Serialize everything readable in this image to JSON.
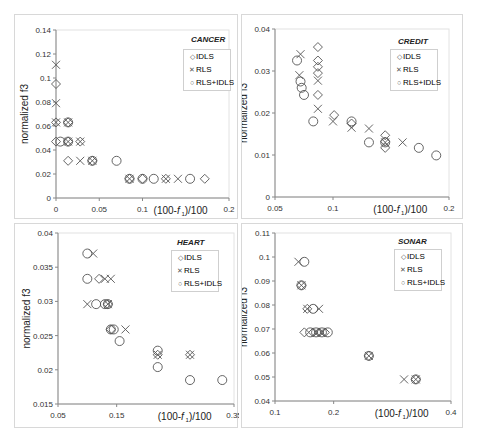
{
  "chart_data": [
    {
      "type": "scatter",
      "title": "CANCER",
      "xlabel": "(100-f1)/100",
      "ylabel": "normalized f3",
      "xlim": [
        0,
        0.2
      ],
      "ylim": [
        0,
        0.14
      ],
      "xticks": [
        "0",
        "0.05",
        "0.1",
        "0.2"
      ],
      "xtick_values": [
        0,
        0.05,
        0.1,
        0.2
      ],
      "yticks": [
        "0",
        "0.02",
        "0.04",
        "0.06",
        "0.08",
        "0.1",
        "0.12",
        "0.14"
      ],
      "ytick_values": [
        0,
        0.02,
        0.04,
        0.06,
        0.08,
        0.1,
        0.12,
        0.14
      ],
      "legend": [
        "IDLS",
        "RLS",
        "RLS+IDLS"
      ],
      "series": [
        {
          "name": "IDLS",
          "marker": "diamond",
          "points": [
            [
              0,
              0.095
            ],
            [
              0,
              0.063
            ],
            [
              0,
              0.047
            ],
            [
              0.014,
              0.063
            ],
            [
              0.014,
              0.047
            ],
            [
              0.014,
              0.031
            ],
            [
              0.028,
              0.047
            ],
            [
              0.042,
              0.031
            ],
            [
              0.085,
              0.016
            ],
            [
              0.1,
              0.016
            ],
            [
              0.127,
              0.016
            ],
            [
              0.172,
              0.016
            ]
          ]
        },
        {
          "name": "RLS",
          "marker": "x",
          "points": [
            [
              0,
              0.111
            ],
            [
              0,
              0.079
            ],
            [
              0,
              0.063
            ],
            [
              0.014,
              0.063
            ],
            [
              0.014,
              0.047
            ],
            [
              0.028,
              0.047
            ],
            [
              0.028,
              0.031
            ],
            [
              0.042,
              0.031
            ],
            [
              0.085,
              0.016
            ],
            [
              0.127,
              0.016
            ],
            [
              0.141,
              0.016
            ]
          ]
        },
        {
          "name": "RLS+IDLS",
          "marker": "circle",
          "points": [
            [
              0.005,
              0.047
            ],
            [
              0.014,
              0.063
            ],
            [
              0.014,
              0.047
            ],
            [
              0.042,
              0.031
            ],
            [
              0.07,
              0.031
            ],
            [
              0.085,
              0.016
            ],
            [
              0.1,
              0.016
            ],
            [
              0.113,
              0.016
            ],
            [
              0.155,
              0.016
            ]
          ]
        }
      ]
    },
    {
      "type": "scatter",
      "title": "CREDIT",
      "xlabel": "(100-f1)/100",
      "ylabel": "normalized f3",
      "xlim": [
        0.05,
        0.2
      ],
      "ylim": [
        0,
        0.04
      ],
      "xticks": [
        "0.05",
        "0.1",
        "0.2"
      ],
      "xtick_values": [
        0.05,
        0.1,
        0.2
      ],
      "yticks": [
        "0",
        "0.01",
        "0.02",
        "0.03",
        "0.04"
      ],
      "ytick_values": [
        0,
        0.01,
        0.02,
        0.03,
        0.04
      ],
      "legend": [
        "IDLS",
        "RLS",
        "RLS+IDLS"
      ],
      "series": [
        {
          "name": "IDLS",
          "marker": "diamond",
          "points": [
            [
              0.087,
              0.0357
            ],
            [
              0.087,
              0.0325
            ],
            [
              0.087,
              0.031
            ],
            [
              0.087,
              0.0295
            ],
            [
              0.087,
              0.0243
            ],
            [
              0.101,
              0.0195
            ],
            [
              0.116,
              0.0175
            ],
            [
              0.145,
              0.0147
            ],
            [
              0.145,
              0.0132
            ],
            [
              0.145,
              0.0117
            ]
          ]
        },
        {
          "name": "RLS",
          "marker": "x",
          "points": [
            [
              0.072,
              0.034
            ],
            [
              0.071,
              0.029
            ],
            [
              0.087,
              0.0277
            ],
            [
              0.087,
              0.021
            ],
            [
              0.1,
              0.018
            ],
            [
              0.116,
              0.0165
            ],
            [
              0.131,
              0.0163
            ],
            [
              0.145,
              0.013
            ],
            [
              0.16,
              0.013
            ]
          ]
        },
        {
          "name": "RLS+IDLS",
          "marker": "circle",
          "points": [
            [
              0.069,
              0.0325
            ],
            [
              0.072,
              0.0275
            ],
            [
              0.073,
              0.026
            ],
            [
              0.075,
              0.0243
            ],
            [
              0.083,
              0.018
            ],
            [
              0.116,
              0.018
            ],
            [
              0.131,
              0.013
            ],
            [
              0.145,
              0.013
            ],
            [
              0.174,
              0.0117
            ],
            [
              0.189,
              0.0099
            ]
          ]
        }
      ]
    },
    {
      "type": "scatter",
      "title": "HEART",
      "xlabel": "(100-f1)/100",
      "ylabel": "normalized f3",
      "xlim": [
        0.05,
        0.35
      ],
      "ylim": [
        0.015,
        0.04
      ],
      "xticks": [
        "0.05",
        "0.15",
        "0.35"
      ],
      "xtick_values": [
        0.05,
        0.15,
        0.35
      ],
      "yticks": [
        "0.015",
        "0.02",
        "0.025",
        "0.03",
        "0.035",
        "0.04"
      ],
      "ytick_values": [
        0.015,
        0.02,
        0.025,
        0.03,
        0.035,
        0.04
      ],
      "legend": [
        "IDLS",
        "RLS",
        "RLS+IDLS"
      ],
      "series": [
        {
          "name": "IDLS",
          "marker": "diamond",
          "points": [
            [
              0.12,
              0.0333
            ],
            [
              0.135,
              0.0296
            ],
            [
              0.14,
              0.0259
            ],
            [
              0.22,
              0.0222
            ],
            [
              0.275,
              0.0222
            ]
          ]
        },
        {
          "name": "RLS",
          "marker": "x",
          "points": [
            [
              0.11,
              0.037
            ],
            [
              0.1,
              0.0296
            ],
            [
              0.13,
              0.0333
            ],
            [
              0.14,
              0.0333
            ],
            [
              0.135,
              0.0296
            ],
            [
              0.165,
              0.0259
            ],
            [
              0.22,
              0.0222
            ],
            [
              0.275,
              0.0222
            ]
          ]
        },
        {
          "name": "RLS+IDLS",
          "marker": "circle",
          "points": [
            [
              0.1,
              0.037
            ],
            [
              0.1,
              0.0333
            ],
            [
              0.115,
              0.0296
            ],
            [
              0.13,
              0.0296
            ],
            [
              0.135,
              0.0296
            ],
            [
              0.14,
              0.0259
            ],
            [
              0.145,
              0.0259
            ],
            [
              0.155,
              0.0242
            ],
            [
              0.22,
              0.0228
            ],
            [
              0.22,
              0.0204
            ],
            [
              0.275,
              0.0185
            ],
            [
              0.33,
              0.0185
            ]
          ]
        }
      ]
    },
    {
      "type": "scatter",
      "title": "SONAR",
      "xlabel": "(100-f1)/100",
      "ylabel": "normalized f3",
      "xlim": [
        0.1,
        0.4
      ],
      "ylim": [
        0.04,
        0.11
      ],
      "xticks": [
        "0.1",
        "0.2",
        "0.4"
      ],
      "xtick_values": [
        0.1,
        0.2,
        0.4
      ],
      "yticks": [
        "0.04",
        "0.05",
        "0.06",
        "0.07",
        "0.08",
        "0.09",
        "0.1",
        "0.11"
      ],
      "ytick_values": [
        0.04,
        0.05,
        0.06,
        0.07,
        0.08,
        0.09,
        0.1,
        0.11
      ],
      "legend": [
        "IDLS",
        "RLS",
        "RLS+IDLS"
      ],
      "series": [
        {
          "name": "IDLS",
          "marker": "diamond",
          "points": [
            [
              0.145,
              0.0882
            ],
            [
              0.155,
              0.0784
            ],
            [
              0.15,
              0.0686
            ],
            [
              0.165,
              0.0686
            ],
            [
              0.175,
              0.0686
            ],
            [
              0.185,
              0.0686
            ],
            [
              0.26,
              0.0588
            ],
            [
              0.34,
              0.049
            ]
          ]
        },
        {
          "name": "RLS",
          "marker": "x",
          "points": [
            [
              0.14,
              0.098
            ],
            [
              0.145,
              0.0882
            ],
            [
              0.155,
              0.0784
            ],
            [
              0.175,
              0.0784
            ],
            [
              0.17,
              0.0686
            ],
            [
              0.18,
              0.0686
            ],
            [
              0.26,
              0.0588
            ],
            [
              0.32,
              0.049
            ],
            [
              0.34,
              0.049
            ]
          ]
        },
        {
          "name": "RLS+IDLS",
          "marker": "circle",
          "points": [
            [
              0.15,
              0.098
            ],
            [
              0.145,
              0.0882
            ],
            [
              0.165,
              0.0784
            ],
            [
              0.16,
              0.0686
            ],
            [
              0.17,
              0.0686
            ],
            [
              0.18,
              0.0686
            ],
            [
              0.19,
              0.0686
            ],
            [
              0.26,
              0.0588
            ],
            [
              0.34,
              0.049
            ]
          ]
        }
      ]
    }
  ],
  "panels": [
    {
      "title": "CANCER",
      "legend": [
        "IDLS",
        "RLS",
        "RLS+IDLS"
      ],
      "xlabel_prefix": "(100-",
      "xlabel_var": "f",
      "xlabel_sub": "1",
      "xlabel_suffix": ")/100",
      "ylabel": "normalized f3"
    },
    {
      "title": "CREDIT",
      "legend": [
        "IDLS",
        "RLS",
        "RLS+IDLS"
      ],
      "xlabel_prefix": "(100-",
      "xlabel_var": "f",
      "xlabel_sub": "1",
      "xlabel_suffix": ")/100",
      "ylabel": "normalized f3"
    },
    {
      "title": "HEART",
      "legend": [
        "IDLS",
        "RLS",
        "RLS+IDLS"
      ],
      "xlabel_prefix": "(100-",
      "xlabel_var": "f",
      "xlabel_sub": "1",
      "xlabel_suffix": ")/100",
      "ylabel": "normalized f3"
    },
    {
      "title": "SONAR",
      "legend": [
        "IDLS",
        "RLS",
        "RLS+IDLS"
      ],
      "xlabel_prefix": "(100-",
      "xlabel_var": "f",
      "xlabel_sub": "1",
      "xlabel_suffix": ")/100",
      "ylabel": "normalized f3"
    }
  ],
  "colors": {
    "marker": "#555555",
    "axis": "#888888",
    "border": "#d8d8d8",
    "background": "#ffffff"
  }
}
